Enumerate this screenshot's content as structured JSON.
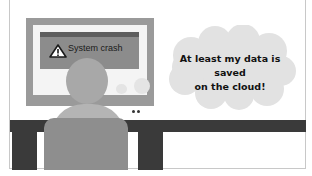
{
  "scene": {
    "description": "Person at desk facing monitor showing a system crash dialog, thinking about cloud backup",
    "colors": {
      "background": "#ffffff",
      "monitor_frame": "#9a9a9a",
      "screen": "#f4f4f4",
      "dialog": "#8c8c8c",
      "dialog_bar": "#5e5e5e",
      "desk": "#3a3a3a",
      "person_head": "#a8a8a8",
      "person_body": "#8e8e8e",
      "cloud": "#e2e2e2"
    }
  },
  "monitor": {
    "dialog": {
      "icon": "warning-triangle-icon",
      "message": "System crash"
    }
  },
  "thought_bubble": {
    "line1": "At least my data is saved",
    "line2": "on the cloud!"
  }
}
